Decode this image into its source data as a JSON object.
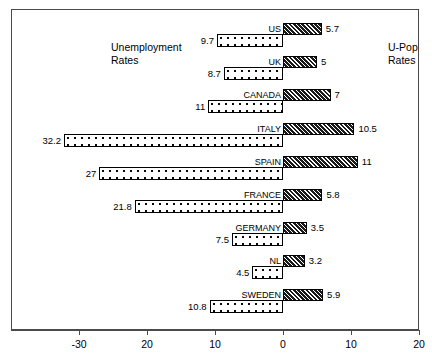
{
  "labels": {
    "left_block": "Unemployment\nRates",
    "right_block": "U-Pop\nRates"
  },
  "chart_data": {
    "type": "bar",
    "title": "",
    "subtitle": "",
    "xlabel": "",
    "ylabel": "",
    "orientation": "horizontal",
    "grid": false,
    "legend_position": "none",
    "axis_note": "Left side plotted as negative extent; tick labels printed without sign except -30",
    "xlim": [
      -30,
      20
    ],
    "xticks": [
      -30,
      -20,
      -10,
      0,
      10,
      20
    ],
    "xticklabels": [
      "-30",
      "20",
      "10",
      "0",
      "10",
      "20"
    ],
    "categories": [
      "US",
      "UK",
      "CANADA",
      "ITALY",
      "SPAIN",
      "FRANCE",
      "GERMANY",
      "NL",
      "SWEDEN"
    ],
    "series": [
      {
        "name": "Unemployment Rates",
        "side": "left",
        "fill": "dotted",
        "values": [
          9.7,
          8.7,
          11,
          32.2,
          27,
          21.8,
          7.5,
          4.5,
          10.8
        ]
      },
      {
        "name": "U-Pop Rates",
        "side": "right",
        "fill": "hatched",
        "values": [
          5.7,
          5,
          7,
          10.5,
          11,
          5.8,
          3.5,
          3.2,
          5.9
        ]
      }
    ],
    "rows": [
      {
        "country": "US",
        "left_value": "9.7",
        "right_value": "5.7",
        "left_num": 9.7,
        "right_num": 5.7
      },
      {
        "country": "UK",
        "left_value": "8.7",
        "right_value": "5",
        "left_num": 8.7,
        "right_num": 5
      },
      {
        "country": "CANADA",
        "left_value": "11",
        "right_value": "7",
        "left_num": 11,
        "right_num": 7
      },
      {
        "country": "ITALY",
        "left_value": "32.2",
        "right_value": "10.5",
        "left_num": 32.2,
        "right_num": 10.5
      },
      {
        "country": "SPAIN",
        "left_value": "27",
        "right_value": "11",
        "left_num": 27,
        "right_num": 11
      },
      {
        "country": "FRANCE",
        "left_value": "21.8",
        "right_value": "5.8",
        "left_num": 21.8,
        "right_num": 5.8
      },
      {
        "country": "GERMANY",
        "left_value": "7.5",
        "right_value": "3.5",
        "left_num": 7.5,
        "right_num": 3.5
      },
      {
        "country": "NL",
        "left_value": "4.5",
        "right_value": "3.2",
        "left_num": 4.5,
        "right_num": 3.2
      },
      {
        "country": "SWEDEN",
        "left_value": "10.8",
        "right_value": "5.9",
        "left_num": 10.8,
        "right_num": 5.9
      }
    ]
  },
  "geometry": {
    "zero_x": 272,
    "px_per_unit": 6.8,
    "row_top_first": 14,
    "row_step": 33.2
  }
}
